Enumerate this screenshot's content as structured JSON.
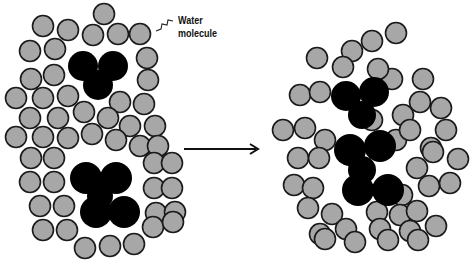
{
  "diagram": {
    "label": {
      "line1": "Water",
      "line2": "molecule"
    },
    "colors": {
      "water_fill": "#a7a7a7",
      "water_stroke": "#1a1a1a",
      "solute_fill": "#000000",
      "arrow": "#111111",
      "background": "#ffffff"
    },
    "water_radius": 10.5,
    "left_panel": {
      "water_molecules": [
        [
          104,
          14
        ],
        [
          43,
          26
        ],
        [
          68,
          30
        ],
        [
          93,
          35
        ],
        [
          118,
          34
        ],
        [
          140,
          34
        ],
        [
          30,
          51
        ],
        [
          55,
          49
        ],
        [
          147,
          58
        ],
        [
          31,
          79
        ],
        [
          54,
          75
        ],
        [
          148,
          80
        ],
        [
          16,
          98
        ],
        [
          43,
          98
        ],
        [
          68,
          96
        ],
        [
          120,
          102
        ],
        [
          144,
          104
        ],
        [
          30,
          118
        ],
        [
          58,
          118
        ],
        [
          84,
          112
        ],
        [
          108,
          118
        ],
        [
          130,
          126
        ],
        [
          155,
          126
        ],
        [
          16,
          137
        ],
        [
          43,
          137
        ],
        [
          68,
          138
        ],
        [
          92,
          134
        ],
        [
          116,
          140
        ],
        [
          140,
          146
        ],
        [
          158,
          146
        ],
        [
          31,
          158
        ],
        [
          54,
          158
        ],
        [
          154,
          163
        ],
        [
          172,
          163
        ],
        [
          30,
          182
        ],
        [
          54,
          182
        ],
        [
          154,
          188
        ],
        [
          172,
          188
        ],
        [
          40,
          206
        ],
        [
          64,
          206
        ],
        [
          156,
          213
        ],
        [
          175,
          212
        ],
        [
          43,
          230
        ],
        [
          67,
          230
        ],
        [
          153,
          227
        ],
        [
          173,
          222
        ],
        [
          85,
          248
        ],
        [
          110,
          246
        ],
        [
          134,
          244
        ]
      ],
      "solutes": [
        {
          "lobes": [
            [
              83,
              66,
              15
            ],
            [
              113,
              66,
              15
            ],
            [
              98,
              85,
              15
            ]
          ]
        },
        {
          "lobes": [
            [
              86,
              178,
              16
            ],
            [
              116,
              178,
              16
            ],
            [
              100,
              196,
              13
            ],
            [
              96,
              212,
              16
            ],
            [
              124,
              212,
              16
            ]
          ]
        }
      ]
    },
    "right_panel": {
      "water_molecules": [
        [
          396,
          33
        ],
        [
          372,
          41
        ],
        [
          352,
          51
        ],
        [
          317,
          58
        ],
        [
          343,
          67
        ],
        [
          392,
          79
        ],
        [
          378,
          69
        ],
        [
          423,
          79
        ],
        [
          300,
          95
        ],
        [
          320,
          92
        ],
        [
          345,
          95
        ],
        [
          403,
          115
        ],
        [
          420,
          102
        ],
        [
          441,
          108
        ],
        [
          446,
          130
        ],
        [
          283,
          130
        ],
        [
          305,
          128
        ],
        [
          325,
          140
        ],
        [
          372,
          120
        ],
        [
          396,
          140
        ],
        [
          431,
          148
        ],
        [
          298,
          158
        ],
        [
          319,
          158
        ],
        [
          417,
          168
        ],
        [
          433,
          152
        ],
        [
          410,
          130
        ],
        [
          458,
          159
        ],
        [
          294,
          185
        ],
        [
          313,
          188
        ],
        [
          402,
          195
        ],
        [
          429,
          186
        ],
        [
          450,
          183
        ],
        [
          308,
          208
        ],
        [
          332,
          214
        ],
        [
          377,
          212
        ],
        [
          400,
          215
        ],
        [
          417,
          211
        ],
        [
          320,
          234
        ],
        [
          346,
          229
        ],
        [
          380,
          229
        ],
        [
          410,
          231
        ],
        [
          436,
          226
        ],
        [
          325,
          239
        ],
        [
          355,
          242
        ],
        [
          388,
          240
        ],
        [
          418,
          240
        ]
      ],
      "solutes": [
        {
          "lobes": [
            [
              346,
              96,
              15
            ],
            [
              374,
              92,
              15
            ],
            [
              362,
              115,
              14
            ]
          ]
        },
        {
          "lobes": [
            [
              350,
              150,
              16
            ],
            [
              380,
              146,
              16
            ],
            [
              362,
              170,
              14
            ],
            [
              358,
              190,
              16
            ],
            [
              388,
              190,
              16
            ]
          ]
        }
      ]
    },
    "arrow": {
      "x1": 184,
      "y1": 149,
      "x2": 258,
      "y2": 149
    }
  }
}
